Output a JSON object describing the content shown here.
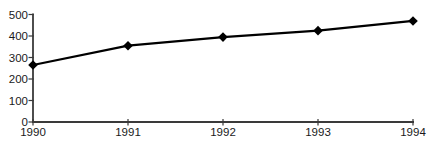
{
  "chart_data": {
    "type": "line",
    "title": "",
    "xlabel": "",
    "ylabel": "",
    "categories": [
      "1990",
      "1991",
      "1992",
      "1993",
      "1994"
    ],
    "series": [
      {
        "name": "series-1",
        "values": [
          265,
          355,
          395,
          425,
          470
        ]
      }
    ],
    "ylim": [
      0,
      500
    ],
    "yticks": [
      0,
      100,
      200,
      300,
      400,
      500
    ],
    "grid": false,
    "legend_position": "none",
    "marker": "diamond",
    "colors": {
      "line": "#000000",
      "marker": "#000000",
      "axis": "#3a3a3a",
      "tick_label": "#1a1a1a",
      "background": "#ffffff"
    }
  }
}
